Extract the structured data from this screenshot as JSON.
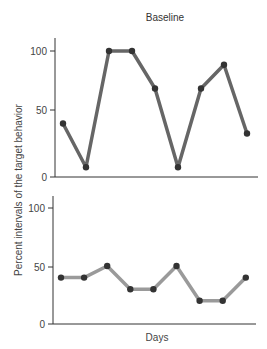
{
  "chart_data": [
    {
      "type": "line",
      "title": "Baseline",
      "xlabel": "",
      "ylabel": "Percent intervals of the target behavior",
      "x": [
        1,
        2,
        3,
        4,
        5,
        6,
        7,
        8,
        9
      ],
      "values": [
        42,
        7,
        100,
        100,
        70,
        7,
        70,
        89,
        34
      ],
      "ylim": [
        0,
        100
      ],
      "yticks": [
        0,
        50,
        100
      ],
      "grid": false,
      "line_color": "#666666",
      "marker_color": "#333333"
    },
    {
      "type": "line",
      "title": "",
      "xlabel": "Days",
      "ylabel": "Percent intervals of the target behavior",
      "x": [
        1,
        2,
        3,
        4,
        5,
        6,
        7,
        8,
        9
      ],
      "values": [
        40,
        40,
        50,
        30,
        30,
        50,
        20,
        20,
        40
      ],
      "ylim": [
        0,
        100
      ],
      "yticks": [
        0,
        50,
        100
      ],
      "grid": false,
      "line_color": "#9a9a9a",
      "marker_color": "#333333"
    }
  ],
  "labels": {
    "title": "Baseline",
    "ylabel": "Percent intervals of the target behavior",
    "xlabel": "Days",
    "tick_0": "0",
    "tick_50": "50",
    "tick_100": "100"
  }
}
